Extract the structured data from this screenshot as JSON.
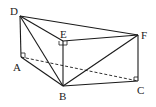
{
  "diagram": {
    "type": "geometry-solid",
    "stroke_color": "#1a1a1a",
    "points": {
      "A": {
        "label": "A",
        "x": 21,
        "y": 57,
        "lx": 13,
        "ly": 71
      },
      "B": {
        "label": "B",
        "x": 63,
        "y": 86,
        "lx": 59,
        "ly": 100
      },
      "C": {
        "label": "C",
        "x": 138,
        "y": 81,
        "lx": 138,
        "ly": 94
      },
      "D": {
        "label": "D",
        "x": 20,
        "y": 16,
        "lx": 10,
        "ly": 15
      },
      "E": {
        "label": "E",
        "x": 63,
        "y": 41,
        "lx": 59,
        "ly": 38
      },
      "F": {
        "label": "F",
        "x": 138,
        "y": 35,
        "lx": 142,
        "ly": 39
      }
    },
    "solid_edges": [
      "DA",
      "DE",
      "DF",
      "DB",
      "EF",
      "EB",
      "FC",
      "FB",
      "AB",
      "BC"
    ],
    "dashed_edges": [
      "AC"
    ],
    "right_angle_marks": [
      "A",
      "E",
      "C"
    ]
  }
}
